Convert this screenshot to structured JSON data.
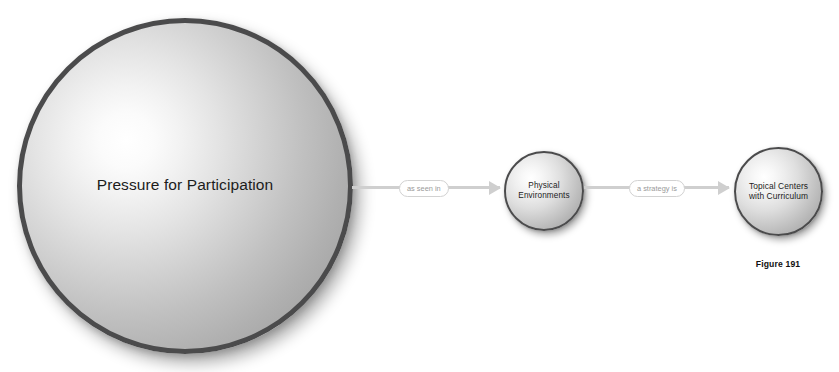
{
  "figure": {
    "caption": "Figure 191",
    "background_color": "#ffffff"
  },
  "diagram": {
    "type": "concept-map",
    "node_border_color": "#4b4b4c",
    "connector_color": "#cfcfcf",
    "nodes": [
      {
        "id": "pressure",
        "label": "Pressure for Participation",
        "size": "large"
      },
      {
        "id": "physical",
        "label": "Physical\nEnvironments",
        "size": "small"
      },
      {
        "id": "topical",
        "label": "Topical Centers\nwith Curriculum",
        "size": "small"
      }
    ],
    "connectors": [
      {
        "id": "connector-1",
        "label": "as seen in",
        "from": "pressure",
        "to": "physical"
      },
      {
        "id": "connector-2",
        "label": "a strategy is",
        "from": "physical",
        "to": "topical"
      }
    ]
  }
}
